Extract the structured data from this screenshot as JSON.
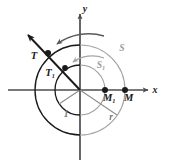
{
  "figure": {
    "background_color": "#ffffff",
    "axes": {
      "x_label": "x",
      "y_label": "y",
      "axis_color": "#4d4d4d",
      "origin": {
        "x": 80,
        "y": 90
      }
    },
    "colors": {
      "dark_curve": "#1a1a1a",
      "light_curve": "#a6a6a6",
      "mid_curve": "#8c8c8c",
      "point_fill": "#1a1a1a",
      "label_dark": "#1a1a1a",
      "label_gray": "#9a9a9a",
      "ray_color": "#1a1a1a"
    },
    "circles": [
      {
        "name": "unit-circle",
        "radius_label": "1",
        "radius_px": 25
      },
      {
        "name": "outer-circle",
        "radius_label": "r",
        "radius_px": 45
      }
    ],
    "points": [
      {
        "name": "T",
        "label": "T",
        "sub": "",
        "x": 48,
        "y": 53
      },
      {
        "name": "T1",
        "label": "T",
        "sub": "1",
        "x": 65,
        "y": 68
      },
      {
        "name": "M1",
        "label": "M",
        "sub": "1",
        "x": 105,
        "y": 90
      },
      {
        "name": "M",
        "label": "M",
        "sub": "",
        "x": 125,
        "y": 90
      }
    ],
    "arc_labels": [
      {
        "name": "S",
        "label": "S",
        "sub": "",
        "x": 122,
        "y": 48
      },
      {
        "name": "S1",
        "label": "S",
        "sub": "1",
        "x": 103,
        "y": 65
      }
    ],
    "radius_labels": [
      {
        "name": "unit-radius-label",
        "label": "1",
        "x": 65,
        "y": 112
      },
      {
        "name": "outer-radius-label",
        "label": "r",
        "x": 110,
        "y": 117
      }
    ],
    "arc_arrows": [
      {
        "name": "outer-arc-arrow",
        "direction": "counterclockwise"
      },
      {
        "name": "inner-arc-arrow",
        "direction": "counterclockwise"
      }
    ],
    "ray": {
      "name": "terminal-ray",
      "from_origin": true,
      "arrow_head": true,
      "angle_description": "upper-left through T1 and T"
    }
  }
}
